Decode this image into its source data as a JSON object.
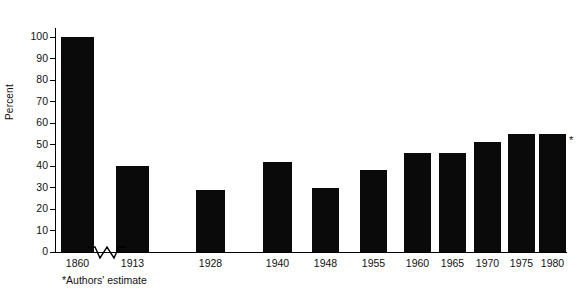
{
  "chart_data": {
    "type": "bar",
    "title": "",
    "xlabel": "",
    "ylabel": "Percent",
    "categories": [
      "1860",
      "1913",
      "1928",
      "1940",
      "1948",
      "1955",
      "1960",
      "1965",
      "1970",
      "1975",
      "1980"
    ],
    "values": [
      100,
      40,
      29,
      42,
      30,
      38,
      46,
      46,
      51,
      55,
      55
    ],
    "ylim": [
      0,
      100
    ],
    "ytick_labels": [
      "0",
      "10",
      "20",
      "30",
      "40",
      "50",
      "60",
      "70",
      "80",
      "90",
      "100"
    ],
    "ytick_values": [
      0,
      10,
      20,
      30,
      40,
      50,
      60,
      70,
      80,
      90,
      100
    ],
    "grid": false,
    "legend": "none",
    "axis_break": "between 1860 and 1913 on x axis",
    "annotations": [
      {
        "label": "*",
        "attached_to": "1980",
        "meaning": "Authors' estimate"
      }
    ],
    "footnote": "*Authors' estimate",
    "bar_color": "#0a0a0a",
    "background_color": "#ffffff"
  }
}
